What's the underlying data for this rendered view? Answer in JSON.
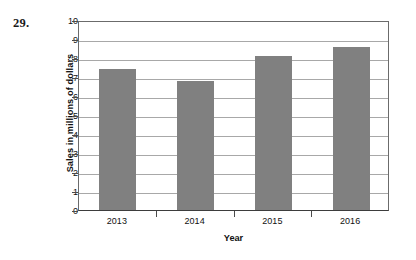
{
  "problem": {
    "number": "29."
  },
  "chart_data": {
    "type": "bar",
    "title": "",
    "xlabel": "Year",
    "ylabel": "Sales in millions of dollars",
    "categories": [
      "2013",
      "2014",
      "2015",
      "2016"
    ],
    "values": [
      7.4,
      6.8,
      8.1,
      8.6
    ],
    "ylim": [
      0,
      10
    ],
    "ytick_labels": [
      "10",
      "9",
      "8",
      "7",
      "6",
      "5",
      "4",
      "3",
      "2",
      "1",
      "0"
    ],
    "ytick_values": [
      10,
      9,
      8,
      7,
      6,
      5,
      4,
      3,
      2,
      1,
      0
    ],
    "grid": true,
    "legend": false,
    "bar_color": "#808080",
    "grid_color": "#a8a8a8",
    "axis_color": "#4a4a4a"
  }
}
